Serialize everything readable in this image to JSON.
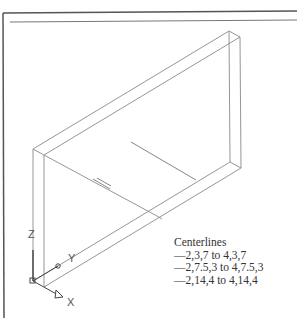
{
  "drawing": {
    "frame_color": "#555555",
    "line_color": "#888888",
    "centerline_color": "#666666"
  },
  "legend": {
    "title": "Centerlines",
    "items": [
      "—2,3,7 to 4,3,7",
      "—2,7.5,3 to 4,7.5,3",
      "—2,14,4 to 4,14,4"
    ]
  },
  "ucs": {
    "z_label": "Z",
    "y_label": "Y",
    "x_label": "X"
  }
}
